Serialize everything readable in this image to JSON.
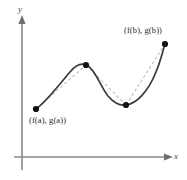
{
  "figure": {
    "background_color": "#ffffff",
    "width": 187,
    "height": 180,
    "axes": {
      "x_label": "x",
      "y_label": "y",
      "axis_color": "#8a8a8a",
      "x_axis_y": 157,
      "y_axis_x": 22,
      "x_arrow_tip": 170,
      "y_arrow_tip": 18
    },
    "curve": {
      "color": "#3a3a3a",
      "chord_color": "#bdbdbd",
      "point_color": "#111111",
      "style": "smooth-cubic",
      "chord_style": "dashed"
    },
    "labels": {
      "start_point": "(f(a), g(a))",
      "end_point": "(f(b), g(b))"
    }
  },
  "chart_data": {
    "type": "line",
    "xlabel": "x",
    "ylabel": "y",
    "grid": false,
    "legend": null,
    "xlim": [
      0,
      187
    ],
    "ylim": [
      0,
      180
    ],
    "annotations": [
      {
        "text": "(f(a), g(a))",
        "x": 36,
        "y": 109,
        "position": "below-right"
      },
      {
        "text": "(f(b), g(b))",
        "x": 165,
        "y": 44,
        "position": "above-left"
      }
    ],
    "series": [
      {
        "name": "parametric curve (f(t), g(t))",
        "style": "solid",
        "color": "#3a3a3a",
        "points": [
          {
            "x": 36,
            "y": 109,
            "marker": true,
            "label": "(f(a), g(a))"
          },
          {
            "x": 86,
            "y": 65,
            "marker": true,
            "label": "local maximum"
          },
          {
            "x": 126,
            "y": 105,
            "marker": true,
            "label": "local minimum"
          },
          {
            "x": 165,
            "y": 44,
            "marker": true,
            "label": "(f(b), g(b))"
          }
        ],
        "path": "M 36 109 C 46 102, 58 86, 70 72 C 76 65, 82 62, 88 66 C 96 71, 100 86, 108 96 C 114 103, 120 106, 126 105 C 136 104, 148 92, 156 72 C 161 60, 163 50, 165 44"
      },
      {
        "name": "chord a to local max",
        "style": "dashed",
        "color": "#bdbdbd",
        "path": "M 36 109 L 86 65"
      },
      {
        "name": "chord local max to local min",
        "style": "dashed",
        "color": "#bdbdbd",
        "path": "M 86 65 L 126 105"
      },
      {
        "name": "chord local min to b",
        "style": "dashed",
        "color": "#bdbdbd",
        "path": "M 126 105 L 165 44"
      }
    ]
  }
}
